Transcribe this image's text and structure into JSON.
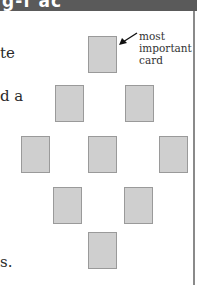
{
  "header": {
    "title_fragment": "g-f ac",
    "background": "#5a5a5a"
  },
  "body_text_fragments": [
    {
      "text": "te",
      "top": 46
    },
    {
      "text": "d a",
      "top": 89
    },
    {
      "text": "s.",
      "top": 255
    }
  ],
  "diagram": {
    "label_lines": [
      "most",
      "important",
      "card"
    ],
    "arrow_icon": "arrow-pointing-to-top-card",
    "card_color": "#cfcfcf",
    "card_border": "#9a9a9a",
    "cards": [
      {
        "id": "card-1",
        "row": 1,
        "left": 88,
        "top": 36
      },
      {
        "id": "card-2",
        "row": 2,
        "left": 55,
        "top": 85
      },
      {
        "id": "card-3",
        "row": 2,
        "left": 125,
        "top": 85
      },
      {
        "id": "card-4",
        "row": 3,
        "left": 21,
        "top": 136
      },
      {
        "id": "card-5",
        "row": 3,
        "left": 88,
        "top": 136
      },
      {
        "id": "card-6",
        "row": 3,
        "left": 159,
        "top": 136
      },
      {
        "id": "card-7",
        "row": 4,
        "left": 53,
        "top": 187
      },
      {
        "id": "card-8",
        "row": 4,
        "left": 124,
        "top": 187
      },
      {
        "id": "card-9",
        "row": 5,
        "left": 88,
        "top": 232
      }
    ]
  }
}
